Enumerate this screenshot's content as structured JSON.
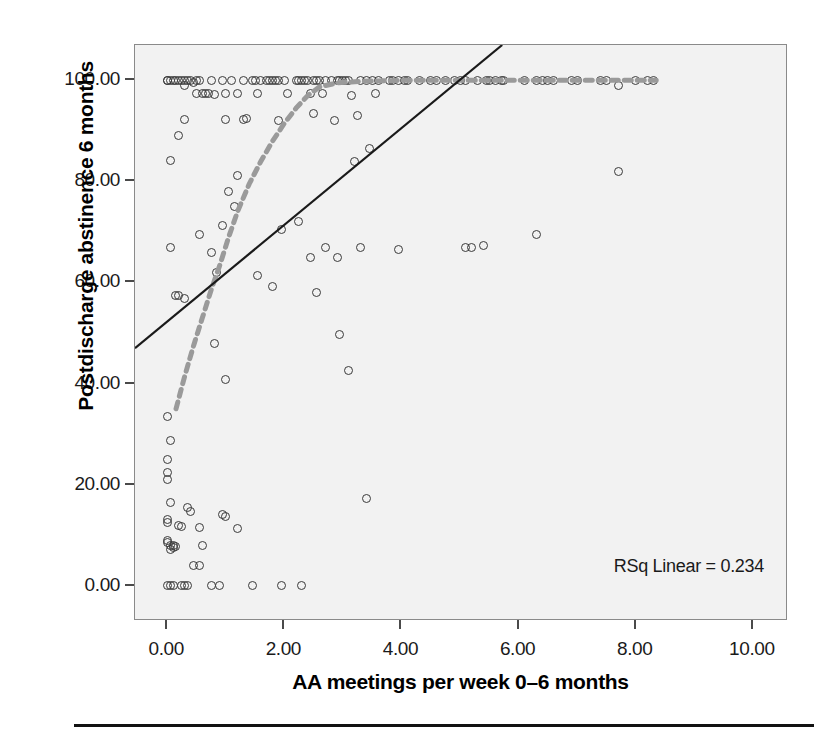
{
  "chart_data": {
    "type": "scatter",
    "title": "",
    "xlabel": "AA meetings per week 0–6 months",
    "ylabel": "Postdischarge abstinence 6 months",
    "xlim": [
      -0.55,
      10.6
    ],
    "ylim": [
      -7.0,
      107.0
    ],
    "grid": false,
    "legend": "none",
    "background_color": "#f2f2f2",
    "marker_style": "open-circle",
    "marker_color": "#3a3a3a",
    "xticks": [
      "0.00",
      "2.00",
      "4.00",
      "6.00",
      "8.00",
      "10.00"
    ],
    "xtick_values": [
      0,
      2,
      4,
      6,
      8,
      10
    ],
    "yticks": [
      "0.00",
      "20.00",
      "40.00",
      "60.00",
      "80.00",
      "100.00"
    ],
    "ytick_values": [
      0,
      20,
      40,
      60,
      80,
      100
    ],
    "annotations": [
      {
        "name": "rsq-linear",
        "text": "RSq Linear = 0.234",
        "value": 0.234
      }
    ],
    "points": [
      [
        0.0,
        100.0
      ],
      [
        0.0,
        100.0
      ],
      [
        0.05,
        100.0
      ],
      [
        0.1,
        100.0
      ],
      [
        0.15,
        100.0
      ],
      [
        0.2,
        100.0
      ],
      [
        0.25,
        100.0
      ],
      [
        0.3,
        100.0
      ],
      [
        0.3,
        99.0
      ],
      [
        0.35,
        100.0
      ],
      [
        0.4,
        100.0
      ],
      [
        0.45,
        99.5
      ],
      [
        0.5,
        100.0
      ],
      [
        0.5,
        97.5
      ],
      [
        0.55,
        100.0
      ],
      [
        0.6,
        97.5
      ],
      [
        0.65,
        97.5
      ],
      [
        0.7,
        97.5
      ],
      [
        0.75,
        100.0
      ],
      [
        0.8,
        97.2
      ],
      [
        0.95,
        100.0
      ],
      [
        1.0,
        97.5
      ],
      [
        1.1,
        100.0
      ],
      [
        1.2,
        97.5
      ],
      [
        1.3,
        100.0
      ],
      [
        1.45,
        100.0
      ],
      [
        1.5,
        100.0
      ],
      [
        1.55,
        97.5
      ],
      [
        1.6,
        100.0
      ],
      [
        1.7,
        100.0
      ],
      [
        1.75,
        100.0
      ],
      [
        1.8,
        100.0
      ],
      [
        1.85,
        100.0
      ],
      [
        1.9,
        100.0
      ],
      [
        2.0,
        100.0
      ],
      [
        2.05,
        97.5
      ],
      [
        2.2,
        100.0
      ],
      [
        2.25,
        100.0
      ],
      [
        2.3,
        100.0
      ],
      [
        2.35,
        100.0
      ],
      [
        2.4,
        100.0
      ],
      [
        2.45,
        97.5
      ],
      [
        2.5,
        100.0
      ],
      [
        2.55,
        100.0
      ],
      [
        2.6,
        100.0
      ],
      [
        2.65,
        97.5
      ],
      [
        2.7,
        100.0
      ],
      [
        2.8,
        100.0
      ],
      [
        2.9,
        100.0
      ],
      [
        2.95,
        100.0
      ],
      [
        3.0,
        100.0
      ],
      [
        3.05,
        100.0
      ],
      [
        3.1,
        100.0
      ],
      [
        3.15,
        97.0
      ],
      [
        3.3,
        100.0
      ],
      [
        3.4,
        100.0
      ],
      [
        3.5,
        100.0
      ],
      [
        3.55,
        97.5
      ],
      [
        3.6,
        100.0
      ],
      [
        3.8,
        100.0
      ],
      [
        3.85,
        100.0
      ],
      [
        3.95,
        100.0
      ],
      [
        4.05,
        100.0
      ],
      [
        4.1,
        100.0
      ],
      [
        4.3,
        100.0
      ],
      [
        4.5,
        100.0
      ],
      [
        4.6,
        100.0
      ],
      [
        4.75,
        100.0
      ],
      [
        4.9,
        100.0
      ],
      [
        5.0,
        100.0
      ],
      [
        5.1,
        100.0
      ],
      [
        5.3,
        100.0
      ],
      [
        5.45,
        100.0
      ],
      [
        5.5,
        100.0
      ],
      [
        5.6,
        100.0
      ],
      [
        5.7,
        100.0
      ],
      [
        5.75,
        100.0
      ],
      [
        6.1,
        100.0
      ],
      [
        6.3,
        100.0
      ],
      [
        6.4,
        100.0
      ],
      [
        6.5,
        100.0
      ],
      [
        6.6,
        100.0
      ],
      [
        6.9,
        100.0
      ],
      [
        7.0,
        100.0
      ],
      [
        7.4,
        100.0
      ],
      [
        7.5,
        100.0
      ],
      [
        7.7,
        99.0
      ],
      [
        8.0,
        100.0
      ],
      [
        8.2,
        100.0
      ],
      [
        8.3,
        100.0
      ],
      [
        0.3,
        92.3
      ],
      [
        0.2,
        89.0
      ],
      [
        1.0,
        92.3
      ],
      [
        1.3,
        92.3
      ],
      [
        1.35,
        92.5
      ],
      [
        1.9,
        92.0
      ],
      [
        2.5,
        93.5
      ],
      [
        2.85,
        92.0
      ],
      [
        3.25,
        93.0
      ],
      [
        0.05,
        84.2
      ],
      [
        1.2,
        81.2
      ],
      [
        3.45,
        86.5
      ],
      [
        3.2,
        84.0
      ],
      [
        7.7,
        82.0
      ],
      [
        1.05,
        78.0
      ],
      [
        1.15,
        75.0
      ],
      [
        0.95,
        71.2
      ],
      [
        1.95,
        70.5
      ],
      [
        2.25,
        72.0
      ],
      [
        0.55,
        69.5
      ],
      [
        0.05,
        67.0
      ],
      [
        0.75,
        66.0
      ],
      [
        2.7,
        67.0
      ],
      [
        3.3,
        67.0
      ],
      [
        3.95,
        66.5
      ],
      [
        5.1,
        67.0
      ],
      [
        5.2,
        67.0
      ],
      [
        5.4,
        67.3
      ],
      [
        6.3,
        69.5
      ],
      [
        2.45,
        65.0
      ],
      [
        2.9,
        65.0
      ],
      [
        0.85,
        62.0
      ],
      [
        1.55,
        61.3
      ],
      [
        0.15,
        57.5
      ],
      [
        0.2,
        57.5
      ],
      [
        0.3,
        56.8
      ],
      [
        1.8,
        59.3
      ],
      [
        2.55,
        58.0
      ],
      [
        2.95,
        49.7
      ],
      [
        0.8,
        48.0
      ],
      [
        3.1,
        42.5
      ],
      [
        1.0,
        40.7
      ],
      [
        0.0,
        33.5
      ],
      [
        0.05,
        28.7
      ],
      [
        0.0,
        25.0
      ],
      [
        0.0,
        22.3
      ],
      [
        0.0,
        21.0
      ],
      [
        0.05,
        16.5
      ],
      [
        3.4,
        17.3
      ],
      [
        0.35,
        15.5
      ],
      [
        0.4,
        14.7
      ],
      [
        0.95,
        14.0
      ],
      [
        1.0,
        13.7
      ],
      [
        0.0,
        13.0
      ],
      [
        0.0,
        12.5
      ],
      [
        0.2,
        12.0
      ],
      [
        0.25,
        11.8
      ],
      [
        0.55,
        11.5
      ],
      [
        1.2,
        11.3
      ],
      [
        0.0,
        9.0
      ],
      [
        0.0,
        8.5
      ],
      [
        0.05,
        8.0
      ],
      [
        0.1,
        8.0
      ],
      [
        0.15,
        7.8
      ],
      [
        0.1,
        7.5
      ],
      [
        0.05,
        7.2
      ],
      [
        0.6,
        8.0
      ],
      [
        0.45,
        4.0
      ],
      [
        0.55,
        3.9
      ],
      [
        0.0,
        0.0
      ],
      [
        0.05,
        0.0
      ],
      [
        0.1,
        0.0
      ],
      [
        0.25,
        0.0
      ],
      [
        0.3,
        0.0
      ],
      [
        0.35,
        0.0
      ],
      [
        0.75,
        0.0
      ],
      [
        0.9,
        0.0
      ],
      [
        1.45,
        0.0
      ],
      [
        1.95,
        0.0
      ],
      [
        2.3,
        0.0
      ]
    ],
    "series": [
      {
        "name": "linear-fit",
        "type": "line",
        "style": "solid",
        "color": "#1a1a1a",
        "rsq": 0.234,
        "points": [
          [
            -0.55,
            47.0
          ],
          [
            5.72,
            107.0
          ]
        ]
      },
      {
        "name": "loess-fit",
        "type": "line",
        "style": "dashed",
        "color": "#9a9a9a",
        "points": [
          [
            0.15,
            35.0
          ],
          [
            0.3,
            41.5
          ],
          [
            0.45,
            47.5
          ],
          [
            0.6,
            53.0
          ],
          [
            0.75,
            58.5
          ],
          [
            0.9,
            63.5
          ],
          [
            1.05,
            69.0
          ],
          [
            1.2,
            74.0
          ],
          [
            1.4,
            79.5
          ],
          [
            1.6,
            84.0
          ],
          [
            1.8,
            88.0
          ],
          [
            2.0,
            91.5
          ],
          [
            2.2,
            94.5
          ],
          [
            2.4,
            97.0
          ],
          [
            2.6,
            98.7
          ],
          [
            2.9,
            99.5
          ],
          [
            3.3,
            99.8
          ],
          [
            4.0,
            100.0
          ],
          [
            5.0,
            100.0
          ],
          [
            6.0,
            100.0
          ],
          [
            7.0,
            100.0
          ],
          [
            8.0,
            100.0
          ],
          [
            8.35,
            100.0
          ]
        ]
      }
    ]
  }
}
